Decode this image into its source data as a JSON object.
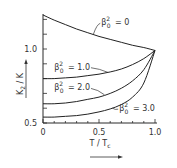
{
  "chart_data": {
    "type": "line",
    "title": "",
    "xlabel": "T / T_c",
    "ylabel": "K_2 / K",
    "xlim": [
      0,
      1.0
    ],
    "ylim": [
      0.5,
      1.25
    ],
    "grid": false,
    "x_ticks": [
      0,
      0.1,
      0.2,
      0.3,
      0.4,
      0.5,
      0.6,
      0.7,
      0.8,
      0.9,
      1.0
    ],
    "x_tick_labels": [
      {
        "value": 0,
        "label": "0"
      },
      {
        "value": 0.5,
        "label": "0.5"
      },
      {
        "value": 1.0,
        "label": "1.0"
      }
    ],
    "y_ticks": [
      0.5,
      0.6,
      0.7,
      0.8,
      0.9,
      1.0,
      1.1,
      1.2
    ],
    "y_tick_labels": [
      {
        "value": 0.5,
        "label": "0.5"
      },
      {
        "value": 1.0,
        "label": "1.0"
      }
    ],
    "series": [
      {
        "name": "β0² = 0",
        "label_base": "β",
        "label_sub": "0",
        "label_sup": "2",
        "label_value": "= 0",
        "x": [
          0,
          0.1,
          0.2,
          0.3,
          0.4,
          0.5,
          0.6,
          0.7,
          0.8,
          0.9,
          1.0
        ],
        "y": [
          1.23,
          1.195,
          1.165,
          1.135,
          1.11,
          1.085,
          1.065,
          1.045,
          1.025,
          1.01,
          0.99
        ]
      },
      {
        "name": "β0² = 1.0",
        "label_base": "β",
        "label_sub": "0",
        "label_sup": "2",
        "label_value": "= 1.0",
        "x": [
          0,
          0.1,
          0.2,
          0.3,
          0.4,
          0.5,
          0.6,
          0.7,
          0.8,
          0.9,
          1.0
        ],
        "y": [
          0.8,
          0.8,
          0.805,
          0.81,
          0.82,
          0.83,
          0.845,
          0.865,
          0.895,
          0.935,
          0.99
        ]
      },
      {
        "name": "β0² = 2.0",
        "label_base": "β",
        "label_sub": "0",
        "label_sup": "2",
        "label_value": "= 2.0",
        "x": [
          0,
          0.1,
          0.2,
          0.3,
          0.4,
          0.5,
          0.6,
          0.7,
          0.8,
          0.9,
          1.0
        ],
        "y": [
          0.63,
          0.63,
          0.635,
          0.645,
          0.66,
          0.675,
          0.7,
          0.735,
          0.785,
          0.86,
          0.99
        ]
      },
      {
        "name": "β0² = 3.0",
        "label_base": "β",
        "label_sub": "0",
        "label_sup": "2",
        "label_value": "= 3.0",
        "x": [
          0,
          0.1,
          0.2,
          0.3,
          0.4,
          0.5,
          0.6,
          0.7,
          0.8,
          0.9,
          1.0
        ],
        "y": [
          0.54,
          0.54,
          0.545,
          0.55,
          0.56,
          0.575,
          0.595,
          0.625,
          0.675,
          0.77,
          0.99
        ]
      }
    ],
    "annotations": [
      {
        "series": 0,
        "text": "β0² = 0",
        "at_x": 0.45,
        "at_y": 1.1,
        "text_x": 0.52,
        "text_y": 1.16
      },
      {
        "series": 1,
        "text": "β0² = 1.0",
        "at_x": 0.58,
        "at_y": 0.842,
        "text_x": 0.1,
        "text_y": 0.86
      },
      {
        "series": 2,
        "text": "β0² = 2.0",
        "at_x": 0.55,
        "at_y": 0.69,
        "text_x": 0.1,
        "text_y": 0.72
      },
      {
        "series": 3,
        "text": "β0² = 3.0",
        "at_x": 0.62,
        "at_y": 0.6,
        "text_x": 0.68,
        "text_y": 0.58
      }
    ]
  },
  "axis_labels": {
    "x_main": "T / T",
    "x_sub": "c",
    "y_main": "K",
    "y_sub": "2",
    "y_tail": " / K"
  }
}
